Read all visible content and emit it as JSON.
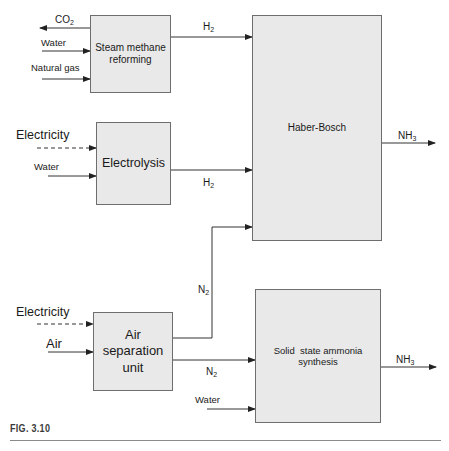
{
  "figure": {
    "caption": "FIG. 3.10"
  },
  "boxes": {
    "smr": {
      "label": "Steam methane\nreforming"
    },
    "electrolysis": {
      "label": "Electrolysis"
    },
    "haber_bosch": {
      "label": "Haber-Bosch"
    },
    "asu": {
      "label": "Air\nseparation\nunit"
    },
    "ssas": {
      "label": "Solid  state ammonia\nsynthesis"
    }
  },
  "flows": {
    "smr_co2": {
      "base": "CO",
      "sub": "2"
    },
    "smr_water": {
      "text": "Water"
    },
    "smr_natural_gas": {
      "text": "Natural gas"
    },
    "smr_h2": {
      "base": "H",
      "sub": "2"
    },
    "elec_electricity": {
      "text": "Electricity"
    },
    "elec_water": {
      "text": "Water"
    },
    "elec_h2": {
      "base": "H",
      "sub": "2"
    },
    "hb_nh3": {
      "base": "NH",
      "sub": "3"
    },
    "asu_electricity": {
      "text": "Electricity"
    },
    "asu_air": {
      "text": "Air"
    },
    "asu_n2_up": {
      "base": "N",
      "sub": "2"
    },
    "asu_n2_right": {
      "base": "N",
      "sub": "2"
    },
    "ssas_water": {
      "text": "Water"
    },
    "ssas_nh3": {
      "base": "NH",
      "sub": "3"
    }
  },
  "colors": {
    "box_fill": "#e9e9e9",
    "box_border": "#6e6e6e",
    "line": "#333333",
    "text": "#1a1a1a"
  }
}
